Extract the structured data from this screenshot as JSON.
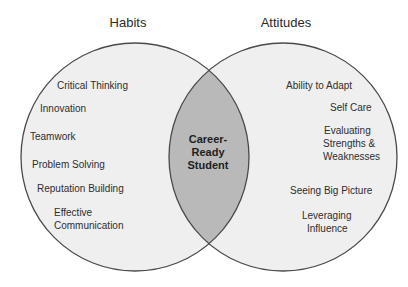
{
  "diagram": {
    "type": "venn",
    "colors": {
      "circle_fill": "#efefef",
      "intersection_fill": "#b9b9b9",
      "outline": "#4a4a4a",
      "background": "#ffffff"
    },
    "left": {
      "title": "Habits",
      "items": [
        "Critical Thinking",
        "Innovation",
        "Teamwork",
        "Problem Solving",
        "Reputation Building",
        "Effective",
        "Communication"
      ]
    },
    "right": {
      "title": "Attitudes",
      "items": [
        "Ability to Adapt",
        "Self Care",
        "Evaluating",
        "Strengths &",
        "Weaknesses",
        "Seeing Big Picture",
        "Leveraging",
        "Influence"
      ]
    },
    "intersection": {
      "lines": [
        "Career-",
        "Ready",
        "Student"
      ]
    }
  }
}
